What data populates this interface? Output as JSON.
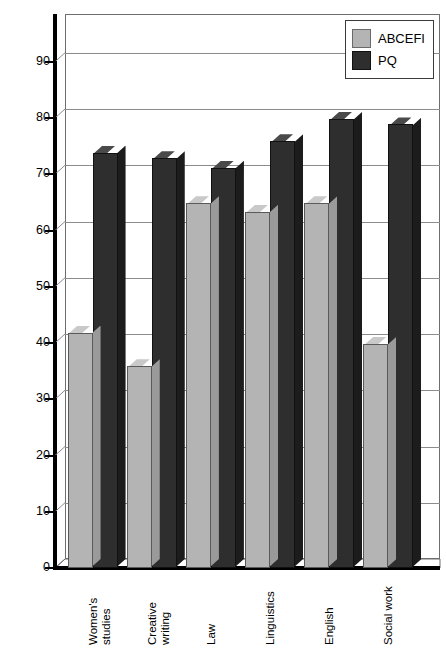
{
  "chart_data": {
    "type": "bar",
    "title": "",
    "xlabel": "",
    "ylabel": "",
    "ylim": [
      0,
      95
    ],
    "ytick_step": 10,
    "yticks": [
      0,
      10,
      20,
      30,
      40,
      50,
      60,
      70,
      80,
      90
    ],
    "grid": true,
    "legend_position": "top-right",
    "style": "3d-column",
    "categories": [
      "Women's\nstudies",
      "Creative\nwriting",
      "Law",
      "Linguistics",
      "English",
      "Social work"
    ],
    "series": [
      {
        "name": "ABCEFI",
        "color": "#b4b4b4",
        "values": [
          41.5,
          35.5,
          64.5,
          63.0,
          64.5,
          39.5
        ]
      },
      {
        "name": "PQ",
        "color": "#2e2e2e",
        "values": [
          73.5,
          72.5,
          70.8,
          75.5,
          79.5,
          78.5
        ]
      }
    ]
  },
  "legend": {
    "items": [
      {
        "label": "ABCEFI"
      },
      {
        "label": "PQ"
      }
    ]
  }
}
